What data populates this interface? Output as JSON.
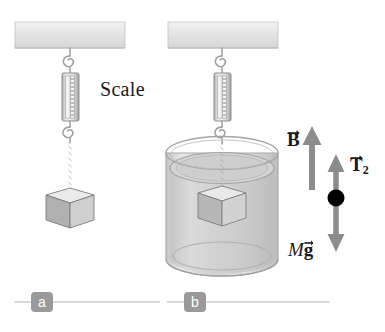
{
  "figure": {
    "background_color": "#ffffff"
  },
  "panels": [
    {
      "tag": "a",
      "caption_tag": "a",
      "description": "Block hanging in air from a spring scale attached to ceiling support",
      "ceiling_label": "ceiling-support",
      "scale_label": "Scale",
      "block_label": "block"
    },
    {
      "tag": "b",
      "caption_tag": "b",
      "description": "Block submerged in fluid inside beaker, hanging from spring scale",
      "ceiling_label": "ceiling-support",
      "block_label": "block",
      "beaker_label": "beaker-with-fluid"
    }
  ],
  "free_body": {
    "buoyant_force": {
      "symbol": "B",
      "name": "buoyant-force",
      "direction": "up"
    },
    "tension": {
      "symbol": "T",
      "subscript": "2",
      "name": "tension-force",
      "direction": "up"
    },
    "weight": {
      "mass_symbol": "M",
      "gravity_symbol": "g",
      "name": "weight-force",
      "direction": "down"
    },
    "point_label": "particle-dot"
  },
  "colors": {
    "ceiling": "#e3e3e3",
    "ceiling_edge": "#b9b9b9",
    "arrow_gray": "#8c8c8c",
    "tag_gray": "#9a9a9a",
    "rule_gray": "#b5b5b5",
    "cube_top": "#e6e6e6",
    "cube_left": "#b3b3b3",
    "cube_right": "#cdcdcd",
    "beaker_glass": "#d8d8d8",
    "fluid": "#cfcfcf",
    "text": "#1a1a1a",
    "dot": "#000000"
  }
}
